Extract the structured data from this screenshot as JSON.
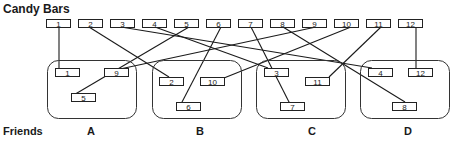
{
  "title": "Candy Bars",
  "friends_label": "Friends",
  "colors": {
    "line": "#1a1a1a",
    "box_stroke": "#222222",
    "group_stroke": "#333333",
    "background": "#ffffff"
  },
  "candy_bars": [
    {
      "label": "1",
      "x": 46,
      "y": 19
    },
    {
      "label": "2",
      "x": 78,
      "y": 19
    },
    {
      "label": "3",
      "x": 110,
      "y": 19
    },
    {
      "label": "4",
      "x": 142,
      "y": 19
    },
    {
      "label": "5",
      "x": 174,
      "y": 19
    },
    {
      "label": "6",
      "x": 206,
      "y": 19
    },
    {
      "label": "7",
      "x": 238,
      "y": 19
    },
    {
      "label": "8",
      "x": 270,
      "y": 19
    },
    {
      "label": "9",
      "x": 302,
      "y": 19
    },
    {
      "label": "10",
      "x": 334,
      "y": 19
    },
    {
      "label": "11",
      "x": 366,
      "y": 19
    },
    {
      "label": "12",
      "x": 398,
      "y": 19
    }
  ],
  "groups": [
    {
      "label": "A",
      "x": 47,
      "y": 60,
      "w": 89,
      "h": 58,
      "label_x": 87,
      "items": [
        {
          "label": "1",
          "x": 55,
          "y": 68
        },
        {
          "label": "9",
          "x": 104,
          "y": 68
        },
        {
          "label": "5",
          "x": 71,
          "y": 93
        }
      ]
    },
    {
      "label": "B",
      "x": 152,
      "y": 60,
      "w": 89,
      "h": 58,
      "label_x": 196,
      "items": [
        {
          "label": "2",
          "x": 159,
          "y": 77
        },
        {
          "label": "10",
          "x": 200,
          "y": 77
        },
        {
          "label": "6",
          "x": 176,
          "y": 102
        }
      ]
    },
    {
      "label": "C",
      "x": 256,
      "y": 60,
      "w": 89,
      "h": 58,
      "label_x": 308,
      "items": [
        {
          "label": "3",
          "x": 264,
          "y": 68
        },
        {
          "label": "11",
          "x": 305,
          "y": 77
        },
        {
          "label": "7",
          "x": 280,
          "y": 102
        }
      ]
    },
    {
      "label": "D",
      "x": 360,
      "y": 60,
      "w": 89,
      "h": 58,
      "label_x": 404,
      "items": [
        {
          "label": "4",
          "x": 368,
          "y": 68
        },
        {
          "label": "12",
          "x": 408,
          "y": 68
        },
        {
          "label": "8",
          "x": 392,
          "y": 102
        }
      ]
    }
  ],
  "links": [
    {
      "from": "1",
      "to": "A-1",
      "x1": 59,
      "y1": 27,
      "x2": 59,
      "y2": 68
    },
    {
      "from": "2",
      "to": "B-2",
      "x1": 89,
      "y1": 27,
      "x2": 169,
      "y2": 77
    },
    {
      "from": "3",
      "to": "D-4",
      "x1": 121,
      "y1": 27,
      "x2": 372,
      "y2": 68
    },
    {
      "from": "4",
      "to": "C-3",
      "x1": 155,
      "y1": 27,
      "x2": 268,
      "y2": 68
    },
    {
      "from": "5",
      "to": "A-5",
      "x1": 189,
      "y1": 27,
      "x2": 72,
      "y2": 96
    },
    {
      "from": "6",
      "to": "B-6",
      "x1": 221,
      "y1": 27,
      "x2": 181,
      "y2": 104
    },
    {
      "from": "7",
      "to": "C-7",
      "x1": 251,
      "y1": 27,
      "x2": 290,
      "y2": 104
    },
    {
      "from": "8",
      "to": "D-8",
      "x1": 283,
      "y1": 27,
      "x2": 405,
      "y2": 102
    },
    {
      "from": "9",
      "to": "A-9",
      "x1": 316,
      "y1": 27,
      "x2": 106,
      "y2": 72
    },
    {
      "from": "10",
      "to": "B-10",
      "x1": 351,
      "y1": 27,
      "x2": 224,
      "y2": 78
    },
    {
      "from": "11",
      "to": "C-11",
      "x1": 381,
      "y1": 27,
      "x2": 329,
      "y2": 77
    },
    {
      "from": "12",
      "to": "D-12",
      "x1": 416,
      "y1": 27,
      "x2": 416,
      "y2": 68
    }
  ]
}
